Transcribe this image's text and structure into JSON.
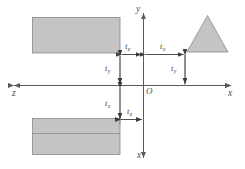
{
  "figure": {
    "background_color": "#ffffff",
    "line_color": "#5a5a5a",
    "shape_fill": "#c4c4c4",
    "shape_stroke": "#7d7d7d",
    "text_color": "#4a4a4a"
  },
  "axes": {
    "y_top_label": "y",
    "x_bottom_label": "x",
    "x_right_label": "x",
    "z_left_label": "z",
    "origin_label": "O"
  },
  "dimensions": [
    {
      "id": "upper-left-horizontal",
      "base": "t",
      "sub": "z",
      "orientation": "horizontal"
    },
    {
      "id": "upper-right-horizontal",
      "base": "t",
      "sub": "x",
      "orientation": "horizontal"
    },
    {
      "id": "upper-left-vertical",
      "base": "t",
      "sub": "y",
      "orientation": "vertical"
    },
    {
      "id": "upper-right-vertical",
      "base": "t",
      "sub": "y",
      "orientation": "vertical"
    },
    {
      "id": "lower-left-vertical",
      "base": "t",
      "sub": "x",
      "orientation": "vertical"
    },
    {
      "id": "lower-right-horizontal",
      "base": "t",
      "sub": "z",
      "orientation": "horizontal"
    }
  ],
  "shapes": [
    {
      "id": "top-left-rectangle",
      "type": "rectangle",
      "divided": false
    },
    {
      "id": "bottom-left-rectangle",
      "type": "rectangle",
      "divided": true
    },
    {
      "id": "right-triangle",
      "type": "triangle",
      "divided": false
    }
  ]
}
